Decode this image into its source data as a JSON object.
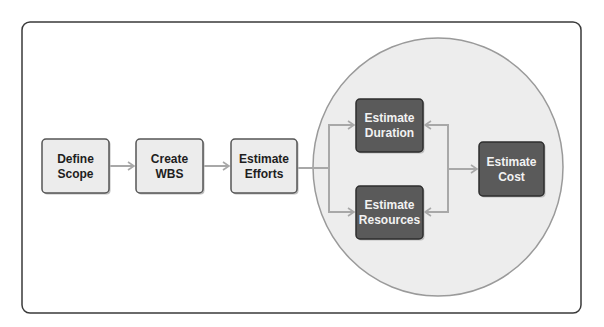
{
  "diagram": {
    "colors": {
      "frame_stroke": "#3a3a3a",
      "circle_fill": "#ededed",
      "circle_stroke": "#9a9a9a",
      "light_box_fill": "#ececec",
      "light_box_stroke": "#555555",
      "dark_box_fill": "#5a5a5a",
      "dark_box_stroke": "#2e2e2e",
      "arrow": "#a8a8a8"
    },
    "nodes": [
      {
        "id": "define-scope",
        "lines": [
          "Define",
          "Scope"
        ],
        "style": "light"
      },
      {
        "id": "create-wbs",
        "lines": [
          "Create",
          "WBS"
        ],
        "style": "light"
      },
      {
        "id": "estimate-efforts",
        "lines": [
          "Estimate",
          "Efforts"
        ],
        "style": "light"
      },
      {
        "id": "estimate-duration",
        "lines": [
          "Estimate",
          "Duration"
        ],
        "style": "dark"
      },
      {
        "id": "estimate-resources",
        "lines": [
          "Estimate",
          "Resources"
        ],
        "style": "dark"
      },
      {
        "id": "estimate-cost",
        "lines": [
          "Estimate",
          "Cost"
        ],
        "style": "dark"
      }
    ],
    "edges": [
      {
        "from": "define-scope",
        "to": "create-wbs"
      },
      {
        "from": "create-wbs",
        "to": "estimate-efforts"
      },
      {
        "from": "estimate-efforts",
        "to": "estimate-duration"
      },
      {
        "from": "estimate-efforts",
        "to": "estimate-resources"
      },
      {
        "from": "estimate-cost",
        "to": "estimate-duration"
      },
      {
        "from": "estimate-cost",
        "to": "estimate-resources"
      },
      {
        "from": "estimate-duration",
        "to": "estimate-cost"
      }
    ],
    "grouping": "Estimate Duration, Estimate Resources and Estimate Cost enclosed in a shaded circle"
  }
}
